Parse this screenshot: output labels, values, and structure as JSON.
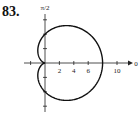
{
  "problem_number": "83.",
  "chart_data": {
    "type": "line",
    "subtype": "polar",
    "title": "",
    "equation_implied": "r = 4 + 4 cos(theta)",
    "top_axis_label": "π/2",
    "right_axis_label": "0",
    "x_tick_labels": [
      "2",
      "4",
      "6",
      "10"
    ],
    "x_ticks": [
      2,
      4,
      6,
      10
    ],
    "y_ticks": [
      -6,
      -4,
      -2,
      2,
      4,
      6
    ],
    "xlim": [
      -3,
      12
    ],
    "ylim": [
      -7,
      8.5
    ],
    "grid": false,
    "series": [
      {
        "name": "cardioid",
        "a": 4,
        "b": 4
      }
    ]
  }
}
